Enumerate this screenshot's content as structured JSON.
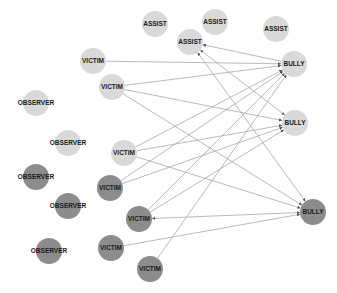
{
  "colors": {
    "background": "#ffffff",
    "node_light": "#d9d9d9",
    "node_dark": "#8c8c8c",
    "edge": "#a8a8a8",
    "label": "#1a1a1a"
  },
  "nodes": [
    {
      "id": "assist1",
      "label": "ASSIST",
      "x": 155,
      "y": 24,
      "shade": "light"
    },
    {
      "id": "assist2",
      "label": "ASSIST",
      "x": 215,
      "y": 22,
      "shade": "light"
    },
    {
      "id": "assist3",
      "label": "ASSIST",
      "x": 190,
      "y": 42,
      "shade": "light"
    },
    {
      "id": "assist4",
      "label": "ASSIST",
      "x": 276,
      "y": 29,
      "shade": "light"
    },
    {
      "id": "bully1",
      "label": "BULLY",
      "x": 294,
      "y": 64,
      "shade": "light"
    },
    {
      "id": "bully2",
      "label": "BULLY",
      "x": 295,
      "y": 123,
      "shade": "light"
    },
    {
      "id": "bully3",
      "label": "BULLY",
      "x": 313,
      "y": 212,
      "shade": "dark"
    },
    {
      "id": "victim1",
      "label": "VICTIM",
      "x": 93,
      "y": 61,
      "shade": "light"
    },
    {
      "id": "victim2",
      "label": "VICTIM",
      "x": 112,
      "y": 87,
      "shade": "light"
    },
    {
      "id": "victim3",
      "label": "VICTIM",
      "x": 124,
      "y": 153,
      "shade": "light"
    },
    {
      "id": "victim4",
      "label": "VICTIM",
      "x": 110,
      "y": 188,
      "shade": "dark"
    },
    {
      "id": "victim5",
      "label": "VICTIM",
      "x": 139,
      "y": 219,
      "shade": "dark"
    },
    {
      "id": "victim6",
      "label": "VICTIM",
      "x": 111,
      "y": 248,
      "shade": "dark"
    },
    {
      "id": "victim7",
      "label": "VICTIM",
      "x": 150,
      "y": 269,
      "shade": "dark"
    },
    {
      "id": "observer1",
      "label": "OBSERVER",
      "x": 36,
      "y": 103,
      "shade": "light"
    },
    {
      "id": "observer2",
      "label": "OBSERVER",
      "x": 68,
      "y": 143,
      "shade": "light"
    },
    {
      "id": "observer3",
      "label": "OBSERVER",
      "x": 36,
      "y": 177,
      "shade": "dark"
    },
    {
      "id": "observer4",
      "label": "OBSERVER",
      "x": 68,
      "y": 206,
      "shade": "dark"
    },
    {
      "id": "observer5",
      "label": "OBSERVER",
      "x": 49,
      "y": 251,
      "shade": "dark"
    }
  ],
  "edges": [
    {
      "from": "victim1",
      "to": "bully1",
      "arrow_end": true,
      "arrow_start": false
    },
    {
      "from": "victim2",
      "to": "bully1",
      "arrow_end": true,
      "arrow_start": false
    },
    {
      "from": "victim2",
      "to": "bully2",
      "arrow_end": true,
      "arrow_start": false
    },
    {
      "from": "victim2",
      "to": "bully3",
      "arrow_end": true,
      "arrow_start": false
    },
    {
      "from": "victim3",
      "to": "bully1",
      "arrow_end": true,
      "arrow_start": false
    },
    {
      "from": "victim3",
      "to": "bully2",
      "arrow_end": true,
      "arrow_start": false
    },
    {
      "from": "victim3",
      "to": "bully3",
      "arrow_end": true,
      "arrow_start": false
    },
    {
      "from": "victim4",
      "to": "bully1",
      "arrow_end": true,
      "arrow_start": false
    },
    {
      "from": "victim4",
      "to": "bully2",
      "arrow_end": true,
      "arrow_start": false
    },
    {
      "from": "victim5",
      "to": "bully1",
      "arrow_end": true,
      "arrow_start": false
    },
    {
      "from": "victim5",
      "to": "bully2",
      "arrow_end": true,
      "arrow_start": false
    },
    {
      "from": "victim5",
      "to": "bully3",
      "arrow_end": true,
      "arrow_start": true
    },
    {
      "from": "victim6",
      "to": "bully3",
      "arrow_end": true,
      "arrow_start": false
    },
    {
      "from": "victim7",
      "to": "bully1",
      "arrow_end": true,
      "arrow_start": false
    },
    {
      "from": "bully1",
      "to": "assist3",
      "arrow_end": true,
      "arrow_start": false
    },
    {
      "from": "assist3",
      "to": "bully2",
      "arrow_end": true,
      "arrow_start": true
    },
    {
      "from": "assist3",
      "to": "bully3",
      "arrow_end": true,
      "arrow_start": true
    }
  ],
  "node_radius": 13
}
